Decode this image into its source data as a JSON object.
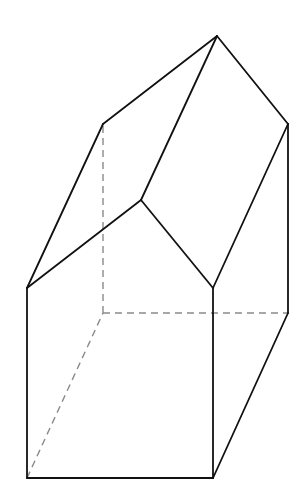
{
  "diagram": {
    "type": "solid-geometry",
    "colors": {
      "visible_edge": "#111111",
      "hidden_edge": "#8a8a8a",
      "background": "#ffffff"
    },
    "vertices": {
      "front_bottom_left": [
        27,
        478
      ],
      "front_bottom_right": [
        213,
        478
      ],
      "front_top_right": [
        213,
        288
      ],
      "front_apex": [
        141,
        200
      ],
      "front_top_left": [
        27,
        288
      ],
      "back_bottom_left": [
        103,
        313
      ],
      "back_bottom_right": [
        288,
        313
      ],
      "back_top_right": [
        288,
        124
      ],
      "back_apex": [
        217,
        36
      ],
      "back_top_left": [
        103,
        124
      ]
    },
    "visible_edges": [
      [
        "front_bottom_left",
        "front_bottom_right"
      ],
      [
        "front_bottom_right",
        "front_top_right"
      ],
      [
        "front_top_right",
        "front_apex"
      ],
      [
        "front_apex",
        "front_top_left"
      ],
      [
        "front_top_left",
        "front_bottom_left"
      ],
      [
        "front_bottom_right",
        "back_bottom_right"
      ],
      [
        "front_top_right",
        "back_top_right"
      ],
      [
        "front_apex",
        "back_apex"
      ],
      [
        "front_top_left",
        "back_top_left"
      ],
      [
        "back_bottom_right",
        "back_top_right"
      ],
      [
        "back_top_right",
        "back_apex"
      ],
      [
        "back_apex",
        "back_top_left"
      ]
    ],
    "hidden_edges": [
      [
        "front_bottom_left",
        "back_bottom_left"
      ],
      [
        "back_bottom_left",
        "back_bottom_right"
      ],
      [
        "back_bottom_left",
        "back_top_left"
      ]
    ]
  }
}
